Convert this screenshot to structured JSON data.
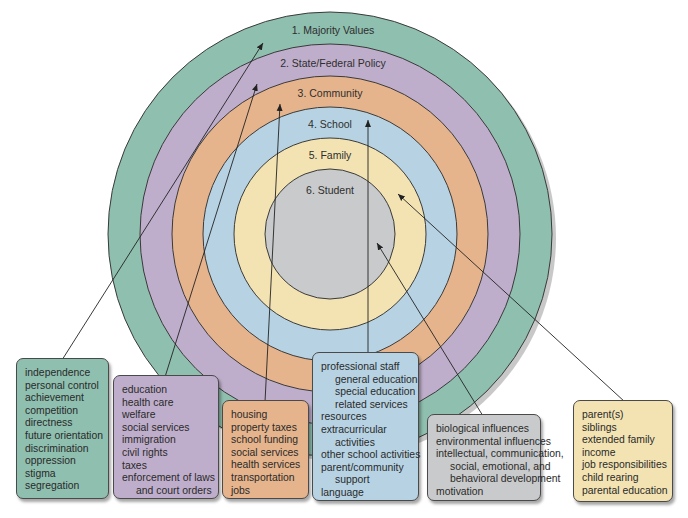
{
  "diagram": {
    "colors": {
      "majority": "#8fbfaf",
      "policy": "#bfaecb",
      "community": "#e6b48c",
      "school": "#b7d3e3",
      "family": "#f3e3b3",
      "student": "#c9cacb",
      "stroke": "#3a3a3a"
    },
    "rings": [
      {
        "id": "majority",
        "label": "1. Majority Values"
      },
      {
        "id": "policy",
        "label": "2. State/Federal Policy"
      },
      {
        "id": "community",
        "label": "3. Community"
      },
      {
        "id": "school",
        "label": "4. School"
      },
      {
        "id": "family",
        "label": "5. Family"
      },
      {
        "id": "student",
        "label": "6. Student"
      }
    ]
  },
  "boxes": {
    "majority": {
      "items": [
        "independence",
        "personal control",
        "achievement",
        "competition",
        "directness",
        "future orientation",
        "discrimination",
        "oppression",
        "stigma",
        "segregation"
      ]
    },
    "policy": {
      "items": [
        "education",
        "health care",
        "welfare",
        "social services",
        "immigration",
        "civil rights",
        "taxes",
        "enforcement of laws",
        "and court orders"
      ]
    },
    "community": {
      "items": [
        "housing",
        "property taxes",
        "school funding",
        "social services",
        "health services",
        "transportation",
        "jobs"
      ]
    },
    "school": {
      "items": [
        "professional staff",
        "general education",
        "special education",
        "related services",
        "resources",
        "extracurricular",
        "activities",
        "other school activities",
        "parent/community",
        "support",
        "language"
      ]
    },
    "student": {
      "items": [
        "biological influences",
        "environmental influences",
        "intellectual, communication,",
        "social, emotional, and",
        "behavioral development",
        "motivation"
      ]
    },
    "family": {
      "items": [
        "parent(s)",
        "siblings",
        "extended family",
        "income",
        "job responsibilities",
        "child rearing",
        "parental education"
      ]
    }
  }
}
